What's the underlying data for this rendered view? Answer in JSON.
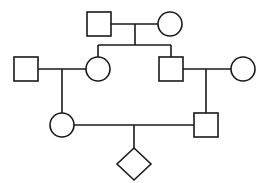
{
  "diagram": {
    "type": "pedigree",
    "colors": {
      "line": "#1a1a1a",
      "fill": "#ffffff",
      "background": "#ffffff"
    },
    "generations": [
      {
        "label": "I",
        "individuals": [
          {
            "id": "I-1",
            "sex": "male",
            "shape": "square",
            "affected": false
          },
          {
            "id": "I-2",
            "sex": "female",
            "shape": "circle",
            "affected": false
          }
        ]
      },
      {
        "label": "II",
        "individuals": [
          {
            "id": "II-1",
            "sex": "male",
            "shape": "square",
            "affected": false,
            "note": "married-in spouse"
          },
          {
            "id": "II-2",
            "sex": "female",
            "shape": "circle",
            "affected": false,
            "parents": [
              "I-1",
              "I-2"
            ]
          },
          {
            "id": "II-3",
            "sex": "male",
            "shape": "square",
            "affected": false,
            "parents": [
              "I-1",
              "I-2"
            ]
          },
          {
            "id": "II-4",
            "sex": "female",
            "shape": "circle",
            "affected": false,
            "note": "married-in spouse"
          }
        ]
      },
      {
        "label": "III",
        "individuals": [
          {
            "id": "III-1",
            "sex": "female",
            "shape": "circle",
            "affected": false,
            "parents": [
              "II-1",
              "II-2"
            ]
          },
          {
            "id": "III-2",
            "sex": "male",
            "shape": "square",
            "affected": false,
            "parents": [
              "II-3",
              "II-4"
            ]
          }
        ]
      },
      {
        "label": "IV",
        "individuals": [
          {
            "id": "IV-1",
            "sex": "unknown",
            "shape": "diamond",
            "affected": false,
            "parents": [
              "III-1",
              "III-2"
            ]
          }
        ]
      }
    ],
    "unions": [
      {
        "partners": [
          "I-1",
          "I-2"
        ],
        "children": [
          "II-2",
          "II-3"
        ],
        "consanguineous": false
      },
      {
        "partners": [
          "II-1",
          "II-2"
        ],
        "children": [
          "III-1"
        ],
        "consanguineous": false
      },
      {
        "partners": [
          "II-3",
          "II-4"
        ],
        "children": [
          "III-2"
        ],
        "consanguineous": false
      },
      {
        "partners": [
          "III-1",
          "III-2"
        ],
        "children": [
          "IV-1"
        ],
        "consanguineous": false,
        "note": "first cousins"
      }
    ]
  }
}
